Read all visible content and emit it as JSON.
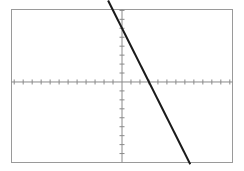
{
  "figure": {
    "background_color": "#ffffff",
    "width": 244,
    "height": 171
  },
  "chart_data": {
    "type": "line",
    "title": "",
    "subtitle": "",
    "xlabel": "",
    "ylabel": "",
    "grid": false,
    "legend": false,
    "legend_position": "none",
    "xlim": [
      -12.3,
      12.3
    ],
    "ylim": [
      -9.0,
      8.1
    ],
    "x_tick_step": 1,
    "y_tick_step": 1,
    "x_tick_values": [
      -12,
      -11,
      -10,
      -9,
      -8,
      -7,
      -6,
      -5,
      -4,
      -3,
      -2,
      -1,
      1,
      2,
      3,
      4,
      5,
      6,
      7,
      8,
      9,
      10,
      11,
      12
    ],
    "y_tick_values": [
      -8,
      -7,
      -6,
      -5,
      -4,
      -3,
      -2,
      -1,
      1,
      2,
      3,
      4,
      5,
      6,
      7,
      8
    ],
    "x_tick_labels": [],
    "y_tick_labels": [],
    "annotations": [],
    "series": [
      {
        "name": "y = -2x + 6",
        "type": "line",
        "equation": "y = -2x + 6",
        "slope": -2,
        "y_intercept": 6,
        "x_intercept": 3,
        "color": "#1a1a1a",
        "line_width": 2,
        "x": [
          -1.55,
          7.6
        ],
        "y": [
          9.1,
          -9.2
        ],
        "points": [
          {
            "x": 0,
            "y": 6
          },
          {
            "x": 3,
            "y": 0
          }
        ]
      }
    ],
    "axes_style": {
      "axis_color": "#8a8a8a",
      "axis_line_width": 1,
      "tick_color": "#8a8a8a",
      "tick_length": 5,
      "border_color": "#9a9a9a",
      "border_line_width": 1
    }
  },
  "axes": {
    "x_axis_name": "x-axis",
    "y_axis_name": "y-axis",
    "origin_label": ""
  }
}
